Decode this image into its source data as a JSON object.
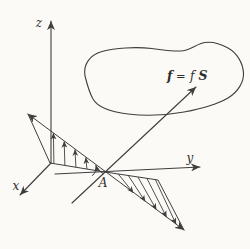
{
  "figure": {
    "background_color": "#fbfaf7",
    "line_color": "#3e3e3e",
    "labels": {
      "z_axis": "z",
      "y_axis": "y",
      "x_axis": "x",
      "point": "A",
      "vector_f": "f",
      "equals": "=",
      "scalar_f": "f",
      "vector_S": "S"
    }
  }
}
